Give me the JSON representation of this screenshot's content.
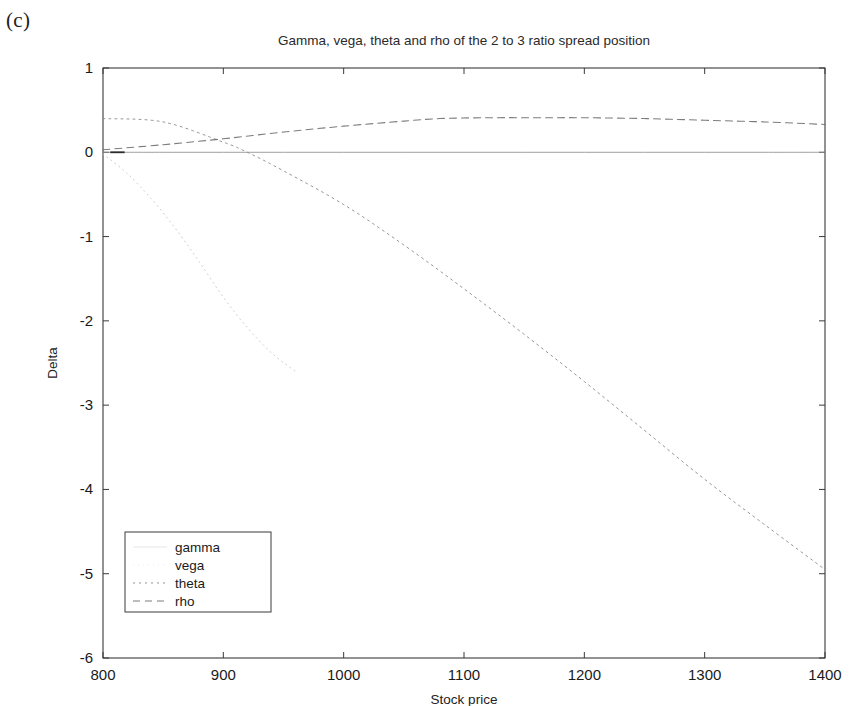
{
  "panel": {
    "label": "(c)"
  },
  "axis_label_y": "Delta",
  "axis_label_x": "Stock price",
  "legend": {
    "items": [
      {
        "label": "gamma",
        "style": "solid-invisible"
      },
      {
        "label": "vega",
        "style": "dotted-faint"
      },
      {
        "label": "theta",
        "style": "dashed"
      },
      {
        "label": "rho",
        "style": "dash-dot"
      }
    ]
  },
  "chart_data": {
    "type": "line",
    "title": "Gamma, vega, theta and rho of the 2 to 3 ratio spread position",
    "xlabel": "Stock price",
    "ylabel": "Delta",
    "xlim": [
      800,
      1400
    ],
    "ylim": [
      -6,
      1
    ],
    "xticks": [
      800,
      900,
      1000,
      1100,
      1200,
      1300,
      1400
    ],
    "yticks": [
      1,
      0,
      -1,
      -2,
      -3,
      -4,
      -5,
      -6
    ],
    "grid": false,
    "legend_position": "lower-left",
    "series": [
      {
        "name": "gamma",
        "x": [
          800,
          850,
          900,
          950,
          1000,
          1050,
          1100,
          1150,
          1200,
          1250,
          1300,
          1350,
          1400
        ],
        "values": [
          0.0,
          0.0,
          0.0,
          0.0,
          0.0,
          0.0,
          0.0,
          0.0,
          0.0,
          0.0,
          0.0,
          0.0,
          0.0
        ]
      },
      {
        "name": "vega",
        "x": [
          800,
          820,
          840,
          860,
          880,
          900,
          920,
          940,
          960
        ],
        "values": [
          -0.02,
          -0.25,
          -0.55,
          -0.9,
          -1.3,
          -1.72,
          -2.08,
          -2.38,
          -2.6
        ]
      },
      {
        "name": "theta",
        "x": [
          800,
          850,
          900,
          920,
          950,
          1000,
          1050,
          1100,
          1150,
          1200,
          1250,
          1300,
          1350,
          1400
        ],
        "values": [
          0.4,
          0.36,
          0.12,
          0.0,
          -0.22,
          -0.62,
          -1.1,
          -1.62,
          -2.16,
          -2.72,
          -3.3,
          -3.88,
          -4.42,
          -4.95
        ]
      },
      {
        "name": "rho",
        "x": [
          800,
          850,
          900,
          950,
          1000,
          1050,
          1080,
          1120,
          1160,
          1200,
          1250,
          1300,
          1350,
          1400
        ],
        "values": [
          0.03,
          0.09,
          0.16,
          0.24,
          0.31,
          0.37,
          0.4,
          0.41,
          0.41,
          0.41,
          0.4,
          0.38,
          0.36,
          0.33
        ]
      }
    ]
  }
}
